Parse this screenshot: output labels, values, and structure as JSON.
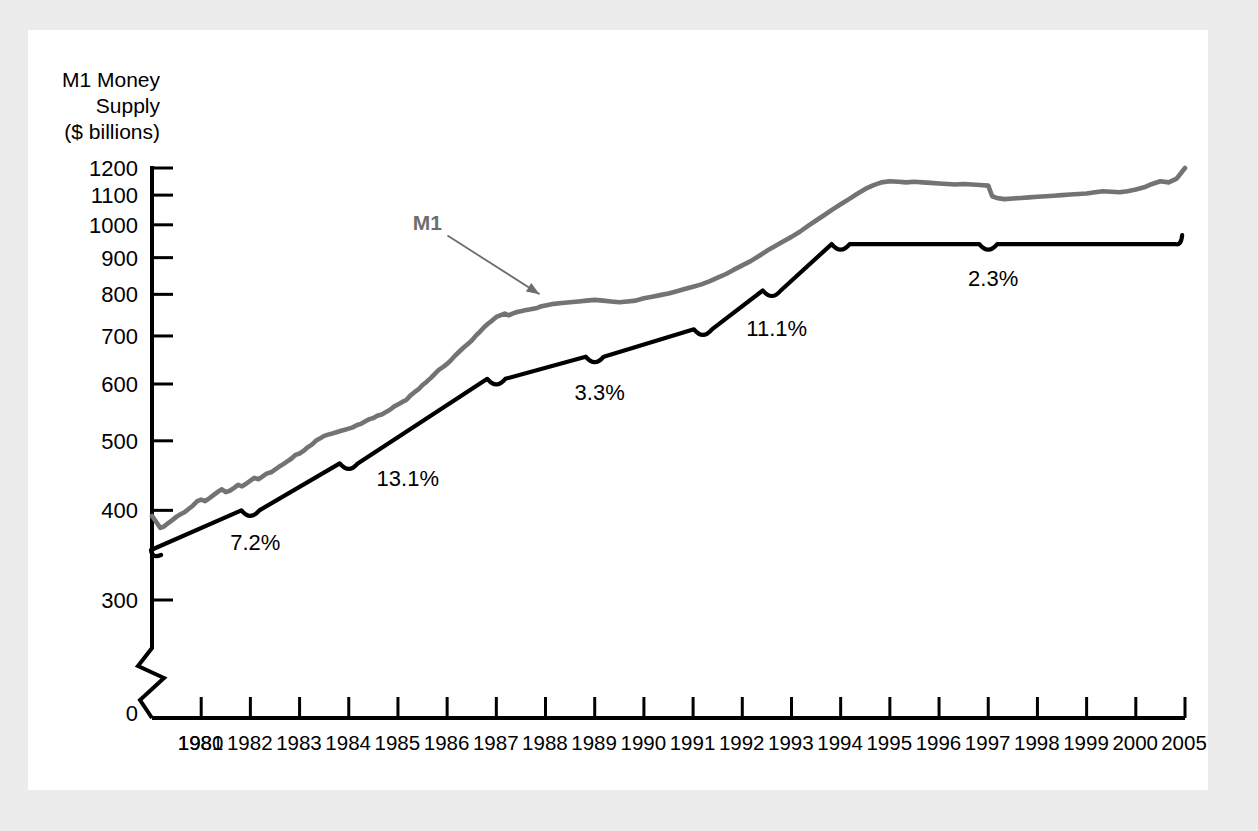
{
  "figure": {
    "background_color": "#ececed",
    "panel_color": "#ffffff",
    "m1_color": "#737373",
    "trend_color": "#000000"
  },
  "chart_data": {
    "type": "line",
    "title": "",
    "subtitle": "",
    "ylabel": "M1 Money Supply ($ billions)",
    "ylabel_lines": [
      "M1 Money",
      "Supply",
      "($ billions)"
    ],
    "xlabel": "",
    "yscale": "log",
    "ylim": [
      290,
      1260
    ],
    "y_axis_break": true,
    "y_zero_label": "0",
    "grid": false,
    "legend": "none",
    "yticks": [
      300,
      400,
      500,
      600,
      700,
      800,
      900,
      1000,
      1100,
      1200
    ],
    "ytick_labels": [
      "300",
      "400",
      "500",
      "600",
      "700",
      "800",
      "900",
      "1000",
      "1100",
      "1200"
    ],
    "xticks": [
      1980,
      1981,
      1982,
      1983,
      1984,
      1985,
      1986,
      1987,
      1988,
      1989,
      1990,
      1991,
      1992,
      1993,
      1994,
      1995,
      1996,
      1997,
      1998,
      1999,
      2000,
      2001
    ],
    "xtick_labels": [
      "1980",
      "1981",
      "1982",
      "1983",
      "1984",
      "1985",
      "1986",
      "1987",
      "1988",
      "1989",
      "1990",
      "1991",
      "1992",
      "1993",
      "1994",
      "1995",
      "1996",
      "1997",
      "1998",
      "1999",
      "2000",
      "2005"
    ],
    "xlim": [
      1980,
      2001
    ],
    "series": [
      {
        "name": "M1",
        "label": "M1",
        "color": "#737373",
        "style": "observed-monthly",
        "x": [
          1980.0,
          1980.08,
          1980.17,
          1980.25,
          1980.33,
          1980.42,
          1980.5,
          1980.58,
          1980.67,
          1980.75,
          1980.83,
          1980.92,
          1981.0,
          1981.08,
          1981.17,
          1981.25,
          1981.33,
          1981.42,
          1981.5,
          1981.58,
          1981.67,
          1981.75,
          1981.83,
          1981.92,
          1982.0,
          1982.08,
          1982.17,
          1982.25,
          1982.33,
          1982.42,
          1982.5,
          1982.58,
          1982.67,
          1982.75,
          1982.83,
          1982.92,
          1983.0,
          1983.08,
          1983.17,
          1983.25,
          1983.33,
          1983.42,
          1983.5,
          1983.58,
          1983.67,
          1983.75,
          1983.83,
          1983.92,
          1984.0,
          1984.08,
          1984.17,
          1984.25,
          1984.33,
          1984.42,
          1984.5,
          1984.58,
          1984.67,
          1984.75,
          1984.83,
          1984.92,
          1985.0,
          1985.08,
          1985.17,
          1985.25,
          1985.33,
          1985.42,
          1985.5,
          1985.58,
          1985.67,
          1985.75,
          1985.83,
          1985.92,
          1986.0,
          1986.08,
          1986.17,
          1986.25,
          1986.33,
          1986.42,
          1986.5,
          1986.58,
          1986.67,
          1986.75,
          1986.83,
          1986.92,
          1987.0,
          1987.08,
          1987.17,
          1987.25,
          1987.33,
          1987.42,
          1987.5,
          1987.58,
          1987.67,
          1987.75,
          1987.83,
          1987.92,
          1988.0,
          1988.17,
          1988.33,
          1988.5,
          1988.67,
          1988.83,
          1989.0,
          1989.17,
          1989.33,
          1989.5,
          1989.67,
          1989.83,
          1990.0,
          1990.17,
          1990.33,
          1990.5,
          1990.67,
          1990.83,
          1991.0,
          1991.17,
          1991.33,
          1991.5,
          1991.67,
          1991.83,
          1992.0,
          1992.17,
          1992.33,
          1992.5,
          1992.67,
          1992.83,
          1993.0,
          1993.17,
          1993.33,
          1993.5,
          1993.67,
          1993.83,
          1994.0,
          1994.17,
          1994.33,
          1994.5,
          1994.67,
          1994.83,
          1995.0,
          1995.17,
          1995.33,
          1995.5,
          1995.67,
          1995.83,
          1996.0,
          1996.17,
          1996.33,
          1996.5,
          1996.67,
          1996.83,
          1997.0,
          1997.08,
          1997.17,
          1997.33,
          1997.5,
          1997.67,
          1997.83,
          1998.0,
          1998.17,
          1998.33,
          1998.5,
          1998.67,
          1998.83,
          1999.0,
          1999.17,
          1999.33,
          1999.5,
          1999.67,
          1999.83,
          2000.0,
          2000.17,
          2000.33,
          2000.5,
          2000.67,
          2000.83,
          2001.0
        ],
        "y": [
          393,
          386,
          378,
          380,
          384,
          388,
          392,
          395,
          398,
          402,
          406,
          412,
          414,
          412,
          416,
          420,
          424,
          428,
          424,
          426,
          430,
          434,
          432,
          436,
          440,
          444,
          442,
          446,
          450,
          452,
          456,
          460,
          464,
          468,
          472,
          478,
          480,
          484,
          490,
          494,
          500,
          504,
          508,
          510,
          512,
          514,
          516,
          518,
          520,
          522,
          526,
          528,
          532,
          536,
          538,
          542,
          544,
          548,
          552,
          558,
          562,
          566,
          570,
          578,
          584,
          590,
          598,
          604,
          612,
          620,
          628,
          634,
          640,
          648,
          658,
          666,
          674,
          682,
          690,
          700,
          710,
          720,
          728,
          736,
          744,
          748,
          752,
          748,
          752,
          756,
          758,
          760,
          762,
          764,
          766,
          770,
          772,
          776,
          778,
          780,
          782,
          784,
          786,
          784,
          782,
          780,
          782,
          784,
          790,
          794,
          798,
          802,
          808,
          814,
          820,
          826,
          834,
          844,
          854,
          866,
          878,
          890,
          904,
          920,
          934,
          948,
          962,
          978,
          996,
          1014,
          1032,
          1050,
          1068,
          1086,
          1104,
          1122,
          1136,
          1146,
          1150,
          1148,
          1146,
          1148,
          1146,
          1144,
          1142,
          1140,
          1138,
          1140,
          1138,
          1136,
          1134,
          1096,
          1090,
          1086,
          1088,
          1090,
          1092,
          1094,
          1096,
          1098,
          1100,
          1102,
          1104,
          1106,
          1110,
          1114,
          1112,
          1110,
          1114,
          1120,
          1128,
          1140,
          1150,
          1146,
          1160,
          1200
        ]
      },
      {
        "name": "Trend",
        "label": "",
        "color": "#000000",
        "style": "piecewise-trend",
        "x": [
          1980.0,
          1982.0,
          1984.0,
          1987.0,
          1989.0,
          1991.2,
          1992.6,
          1994.0,
          1997.0,
          2000.8
        ],
        "y": [
          350,
          400,
          465,
          610,
          655,
          715,
          810,
          940,
          940,
          940
        ]
      }
    ],
    "annotations": [
      {
        "name": "growth-rate-1",
        "text": "7.2%",
        "x": 1982.0,
        "y": 400,
        "label_x": 1982.1,
        "label_y": 352
      },
      {
        "name": "growth-rate-2",
        "text": "13.1%",
        "x": 1984.0,
        "y": 465,
        "label_x": 1985.2,
        "label_y": 432
      },
      {
        "name": "growth-rate-3",
        "text": "3.3%",
        "x": 1989.0,
        "y": 655,
        "label_x": 1989.1,
        "label_y": 570
      },
      {
        "name": "growth-rate-4",
        "text": "11.1%",
        "x": 1992.6,
        "y": 810,
        "label_x": 1992.7,
        "label_y": 700
      },
      {
        "name": "growth-rate-5",
        "text": "2.3%",
        "x": 1997.0,
        "y": 940,
        "label_x": 1997.1,
        "label_y": 822
      },
      {
        "name": "series-callout-m1",
        "text": "M1",
        "x": 1988.0,
        "y": 770,
        "label_x": 1985.6,
        "label_y": 985
      }
    ]
  }
}
